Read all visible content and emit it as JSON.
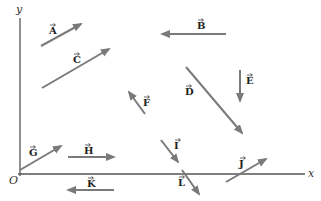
{
  "diagram": {
    "colors": {
      "axis": "#555555",
      "vector": "#7a7a7a",
      "text": "#222222"
    },
    "axes": {
      "origin_label": "O",
      "x_label": "x",
      "y_label": "y",
      "origin": [
        20,
        174
      ],
      "x_end": [
        305,
        174
      ],
      "y_end": [
        20,
        18
      ]
    },
    "vectors": [
      {
        "name": "A",
        "tail": [
          41,
          46
        ],
        "head": [
          81,
          24
        ],
        "label_pos": [
          49,
          34
        ]
      },
      {
        "name": "B",
        "tail": [
          226,
          34
        ],
        "head": [
          162,
          34
        ],
        "label_pos": [
          197,
          29
        ]
      },
      {
        "name": "C",
        "tail": [
          42,
          88
        ],
        "head": [
          109,
          49
        ],
        "label_pos": [
          73,
          63
        ]
      },
      {
        "name": "D",
        "tail": [
          186,
          67
        ],
        "head": [
          242,
          133
        ],
        "label_pos": [
          185,
          95
        ]
      },
      {
        "name": "E",
        "tail": [
          240,
          70
        ],
        "head": [
          240,
          101
        ],
        "label_pos": [
          246,
          84
        ]
      },
      {
        "name": "F",
        "tail": [
          145,
          114
        ],
        "head": [
          129,
          92
        ],
        "label_pos": [
          143,
          106
        ]
      },
      {
        "name": "G",
        "tail": [
          20,
          170
        ],
        "head": [
          61,
          146
        ],
        "label_pos": [
          29,
          156
        ]
      },
      {
        "name": "H",
        "tail": [
          68,
          157
        ],
        "head": [
          114,
          157
        ],
        "label_pos": [
          84,
          154
        ]
      },
      {
        "name": "I",
        "tail": [
          161,
          140
        ],
        "head": [
          178,
          162
        ],
        "label_pos": [
          174,
          149
        ]
      },
      {
        "name": "J",
        "tail": [
          226,
          182
        ],
        "head": [
          266,
          159
        ],
        "label_pos": [
          239,
          167
        ]
      },
      {
        "name": "K",
        "tail": [
          114,
          190
        ],
        "head": [
          68,
          190
        ],
        "label_pos": [
          87,
          187
        ]
      },
      {
        "name": "L",
        "tail": [
          182,
          170
        ],
        "head": [
          199,
          194
        ],
        "label_pos": [
          178,
          186
        ]
      }
    ]
  }
}
